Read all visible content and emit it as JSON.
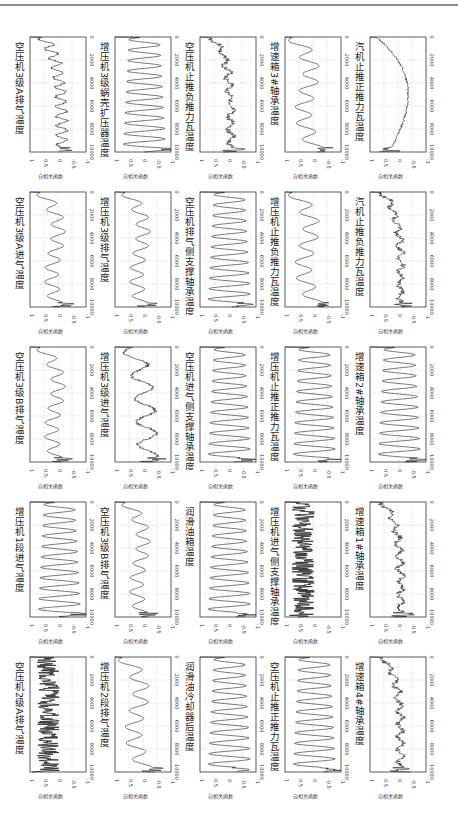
{
  "figure": {
    "layout": "5 columns x 5 rows of autocorrelation subplots, each rotated 90 degrees",
    "ylabel": "自相关函数"
  },
  "chart_data": {
    "type": "line",
    "xlabel": "",
    "ylabel": "自相关函数",
    "xlim": [
      0,
      10000
    ],
    "ylim": [
      -1,
      1
    ],
    "xticks": [
      "0",
      "2000",
      "4000",
      "6000",
      "8000",
      "10000"
    ],
    "yticks": [
      "1",
      "0.5",
      "0",
      "-0.5",
      "-1"
    ],
    "grid": true,
    "plots": [
      {
        "row": 0,
        "col": 0,
        "title": "空压机3级A排气温度",
        "pattern": "decay-noisy"
      },
      {
        "row": 0,
        "col": 1,
        "title": "增压机3级蜗壳扩压器温度",
        "pattern": "oscillating"
      },
      {
        "row": 0,
        "col": 2,
        "title": "空压机止推负推力瓦温度",
        "pattern": "noisy-flat"
      },
      {
        "row": 0,
        "col": 3,
        "title": "增速箱3#轴承温度",
        "pattern": "slow-wave"
      },
      {
        "row": 0,
        "col": 4,
        "title": "汽机止推正推力瓦温度",
        "pattern": "u-shape"
      },
      {
        "row": 1,
        "col": 0,
        "title": "空压机3级A进气温度",
        "pattern": "decay-wave"
      },
      {
        "row": 1,
        "col": 1,
        "title": "增压机3级排气温度",
        "pattern": "decay-wave"
      },
      {
        "row": 1,
        "col": 2,
        "title": "空压机排气侧支撑轴承温度",
        "pattern": "oscillating"
      },
      {
        "row": 1,
        "col": 3,
        "title": "增压机止推负推力瓦温度",
        "pattern": "slow-wave"
      },
      {
        "row": 1,
        "col": 4,
        "title": "汽机止推负推力瓦温度",
        "pattern": "noisy-flat"
      },
      {
        "row": 2,
        "col": 0,
        "title": "空压机3级B排气温度",
        "pattern": "decay-wave"
      },
      {
        "row": 2,
        "col": 1,
        "title": "增压机3级进气温度",
        "pattern": "slow-wave-noisy"
      },
      {
        "row": 2,
        "col": 2,
        "title": "空压机进气侧支撑轴承温度",
        "pattern": "oscillating"
      },
      {
        "row": 2,
        "col": 3,
        "title": "增压机止推正推力瓦温度",
        "pattern": "oscillating"
      },
      {
        "row": 2,
        "col": 4,
        "title": "增速箱2#轴承温度",
        "pattern": "oscillating"
      },
      {
        "row": 3,
        "col": 0,
        "title": "增压机1段进气温度",
        "pattern": "oscillating"
      },
      {
        "row": 3,
        "col": 1,
        "title": "空压机3级B排气温度",
        "pattern": "decay-wave"
      },
      {
        "row": 3,
        "col": 2,
        "title": "润滑油箱温度",
        "pattern": "oscillating"
      },
      {
        "row": 3,
        "col": 3,
        "title": "增压机进气侧支撑轴承温度",
        "pattern": "dense-band"
      },
      {
        "row": 3,
        "col": 4,
        "title": "增速箱1#轴承温度",
        "pattern": "noisy-flat"
      },
      {
        "row": 4,
        "col": 0,
        "title": "空压机2级A排气温度",
        "pattern": "dense-band"
      },
      {
        "row": 4,
        "col": 1,
        "title": "增压机2段排气温度",
        "pattern": "slow-wave"
      },
      {
        "row": 4,
        "col": 2,
        "title": "润滑油冷却器后温度",
        "pattern": "oscillating"
      },
      {
        "row": 4,
        "col": 3,
        "title": "空压机止推正推力瓦温度",
        "pattern": "oscillating"
      },
      {
        "row": 4,
        "col": 4,
        "title": "增速箱4#轴承温度",
        "pattern": "noisy-flat"
      }
    ]
  }
}
